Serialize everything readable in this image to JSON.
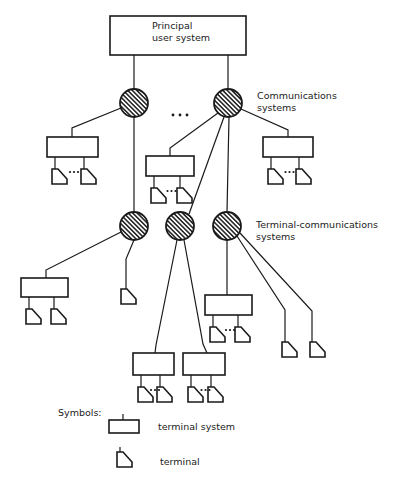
{
  "labels": {
    "principal": [
      "Principal",
      "user system"
    ],
    "communications": [
      "Communications",
      "systems"
    ],
    "terminal_communications": [
      "Terminal-communications",
      "systems"
    ],
    "symbols_heading": "Symbols:",
    "legend_terminal_system": "terminal system",
    "legend_terminal": "terminal",
    "ellipsis": "..."
  },
  "colors": {
    "line": "#1a1a1a",
    "background": "#ffffff"
  },
  "diagram": {
    "root": {
      "id": "principal-user-system",
      "x": 110,
      "y": 16,
      "w": 136,
      "h": 39
    },
    "communications_nodes": [
      {
        "id": "comm-1",
        "cx": 134,
        "cy": 103
      },
      {
        "id": "comm-2",
        "cx": 228,
        "cy": 103
      }
    ],
    "terminal_comm_nodes": [
      {
        "id": "tcomm-1",
        "cx": 134,
        "cy": 226
      },
      {
        "id": "tcomm-2",
        "cx": 180,
        "cy": 226
      },
      {
        "id": "tcomm-3",
        "cx": 227,
        "cy": 226
      }
    ],
    "terminal_systems": [
      {
        "id": "ts-comm1",
        "x": 47,
        "y": 137,
        "w": 51,
        "h": 20,
        "terminals": 2,
        "ellipsis": true
      },
      {
        "id": "ts-comm2-left",
        "x": 146,
        "y": 156,
        "w": 48,
        "h": 20,
        "terminals": 2,
        "ellipsis": true
      },
      {
        "id": "ts-comm2-right",
        "x": 263,
        "y": 137,
        "w": 50,
        "h": 20,
        "terminals": 2,
        "ellipsis": true
      },
      {
        "id": "ts-tcomm1",
        "x": 21,
        "y": 278,
        "w": 47,
        "h": 19,
        "terminals": 2,
        "ellipsis": false
      },
      {
        "id": "ts-tcomm3",
        "x": 205,
        "y": 295,
        "w": 47,
        "h": 20,
        "terminals": 2,
        "ellipsis": true
      },
      {
        "id": "ts-tcomm2-left",
        "x": 133,
        "y": 353,
        "w": 41,
        "h": 22,
        "terminals": 2,
        "ellipsis": true
      },
      {
        "id": "ts-tcomm2-right",
        "x": 183,
        "y": 353,
        "w": 42,
        "h": 22,
        "terminals": 2,
        "ellipsis": true
      }
    ],
    "direct_terminals": [
      {
        "id": "t-tcomm1",
        "x": 121,
        "y": 289
      },
      {
        "id": "t-tcomm3-a",
        "x": 282,
        "y": 342
      },
      {
        "id": "t-tcomm3-b",
        "x": 310,
        "y": 342
      }
    ]
  }
}
